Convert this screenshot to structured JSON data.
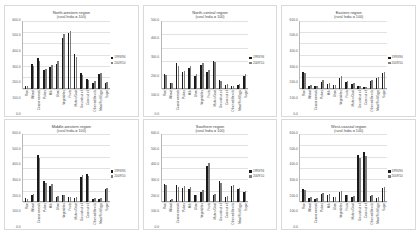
{
  "figure": {
    "background": "#ffffff",
    "series_colors": [
      "#1a1a1a",
      "#7d7d7d"
    ]
  },
  "chart_data": [
    {
      "type": "bar",
      "title": "North-western region",
      "subtitle": "(rural India = 100)",
      "xlabel": "",
      "ylabel": "",
      "ylim": [
        0,
        600
      ],
      "yticks": [
        "0.0",
        "100.0",
        "200.0",
        "300.0",
        "400.0",
        "500.0",
        "600.0"
      ],
      "grid": true,
      "legend_position": "right",
      "categories": [
        "Rice",
        "Wheat",
        "Coarse cereals",
        "Pulses",
        "Milk",
        "Ghee",
        "Vegetables",
        "Fruits",
        "Mutton/Goat",
        "Groundnut oil",
        "Coconut oil",
        "Other edible oils",
        "Meat/Fish/Eggs",
        "Sugar"
      ],
      "series": [
        {
          "name": "1993/94",
          "values": [
            22,
            215,
            268,
            163,
            192,
            214,
            447,
            491,
            309,
            140,
            86,
            48,
            128,
            49,
            214
          ]
        },
        {
          "name": "2009/10",
          "values": [
            18,
            196,
            241,
            176,
            205,
            241,
            486,
            512,
            282,
            121,
            77,
            62,
            141,
            56,
            231
          ]
        }
      ]
    },
    {
      "type": "bar",
      "title": "North-central region",
      "subtitle": "(rural India = 100)",
      "xlabel": "",
      "ylabel": "",
      "ylim": [
        0,
        500
      ],
      "yticks": [
        "0.0",
        "100.0",
        "200.0",
        "300.0",
        "400.0",
        "500.0"
      ],
      "grid": true,
      "legend_position": "right",
      "categories": [
        "Rice",
        "Wheat",
        "Coarse cereals",
        "Pulses",
        "Milk",
        "Ghee",
        "Vegetables",
        "Fruits",
        "Mutton/Goat",
        "Groundnut oil",
        "Coconut oil",
        "Other edible oils",
        "Meat/Fish/Eggs",
        "Sugar"
      ],
      "series": [
        {
          "name": "1993/94",
          "values": [
            104,
            38,
            186,
            118,
            152,
            92,
            171,
            121,
            205,
            64,
            29,
            18,
            24,
            92,
            118
          ]
        },
        {
          "name": "2009/10",
          "values": [
            96,
            44,
            163,
            131,
            168,
            104,
            186,
            138,
            192,
            58,
            34,
            22,
            31,
            106,
            127
          ]
        }
      ]
    },
    {
      "type": "bar",
      "title": "Eastern region",
      "subtitle": "(rural India = 100)",
      "xlabel": "",
      "ylabel": "",
      "ylim": [
        0,
        600
      ],
      "yticks": [
        "0.0",
        "100.0",
        "200.0",
        "300.0",
        "400.0",
        "500.0",
        "600.0"
      ],
      "grid": true,
      "legend_position": "right",
      "categories": [
        "Rice",
        "Wheat",
        "Coarse cereals",
        "Pulses",
        "Milk",
        "Ghee",
        "Vegetables",
        "Fruits",
        "Mutton/Goat",
        "Groundnut oil",
        "Coconut oil",
        "Other edible oils",
        "Meat/Fish/Eggs",
        "Sugar"
      ],
      "series": [
        {
          "name": "1993/94",
          "values": [
            148,
            26,
            21,
            61,
            44,
            27,
            96,
            58,
            41,
            18,
            14,
            68,
            92,
            134,
            38
          ]
        },
        {
          "name": "2009/10",
          "values": [
            139,
            31,
            26,
            72,
            52,
            33,
            108,
            66,
            48,
            22,
            17,
            77,
            104,
            146,
            44
          ]
        }
      ]
    },
    {
      "type": "bar",
      "title": "Middle-western region",
      "subtitle": "(rural India = 100)",
      "xlabel": "",
      "ylabel": "",
      "ylim": [
        0,
        600
      ],
      "yticks": [
        "0.0",
        "100.0",
        "200.0",
        "300.0",
        "400.0",
        "500.0",
        "600.0"
      ],
      "grid": true,
      "legend_position": "right",
      "categories": [
        "Rice",
        "Wheat",
        "Coarse cereals",
        "Pulses",
        "Milk",
        "Ghee",
        "Vegetables",
        "Fruits",
        "Mutton/Goat",
        "Groundnut oil",
        "Coconut oil",
        "Other edible oils",
        "Meat/Fish/Eggs",
        "Sugar"
      ],
      "series": [
        {
          "name": "1993/94",
          "values": [
            34,
            61,
            412,
            186,
            142,
            44,
            58,
            42,
            37,
            219,
            248,
            31,
            28,
            118,
            96
          ]
        },
        {
          "name": "2009/10",
          "values": [
            28,
            72,
            386,
            171,
            158,
            52,
            66,
            48,
            44,
            238,
            226,
            38,
            34,
            127,
            104
          ]
        }
      ]
    },
    {
      "type": "bar",
      "title": "Southern region",
      "subtitle": "(rural India = 100)",
      "xlabel": "",
      "ylabel": "",
      "ylim": [
        0,
        600
      ],
      "yticks": [
        "0.0",
        "100.0",
        "200.0",
        "300.0",
        "400.0",
        "500.0",
        "600.0"
      ],
      "grid": true,
      "legend_position": "right",
      "categories": [
        "Rice",
        "Wheat",
        "Coarse cereals",
        "Pulses",
        "Milk",
        "Ghee",
        "Vegetables",
        "Fruits",
        "Mutton/Goat",
        "Groundnut oil",
        "Coconut oil",
        "Other edible oils",
        "Meat/Fish/Eggs",
        "Sugar"
      ],
      "series": [
        {
          "name": "1993/94",
          "values": [
            156,
            21,
            148,
            127,
            118,
            58,
            92,
            318,
            64,
            182,
            44,
            138,
            112,
            86,
            72
          ]
        },
        {
          "name": "2009/10",
          "values": [
            147,
            26,
            134,
            139,
            131,
            66,
            104,
            341,
            72,
            168,
            52,
            149,
            124,
            94,
            81
          ]
        }
      ]
    },
    {
      "type": "bar",
      "title": "West-coastal region",
      "subtitle": "(rural India = 100)",
      "xlabel": "",
      "ylabel": "",
      "ylim": [
        0,
        600
      ],
      "yticks": [
        "0.0",
        "100.0",
        "200.0",
        "300.0",
        "400.0",
        "500.0",
        "600.0"
      ],
      "grid": true,
      "legend_position": "right",
      "categories": [
        "Rice",
        "Wheat",
        "Coarse cereals",
        "Pulses",
        "Milk",
        "Ghee",
        "Vegetables",
        "Fruits",
        "Mutton/Goat",
        "Groundnut oil",
        "Coconut oil",
        "Other edible oils",
        "Meat/Fish/Eggs",
        "Sugar"
      ],
      "series": [
        {
          "name": "1993/94",
          "values": [
            118,
            34,
            28,
            72,
            64,
            41,
            88,
            58,
            46,
            412,
            438,
            52,
            38,
            124,
            96
          ]
        },
        {
          "name": "2009/10",
          "values": [
            108,
            42,
            33,
            81,
            74,
            48,
            97,
            66,
            54,
            386,
            406,
            61,
            45,
            136,
            107
          ]
        }
      ]
    }
  ]
}
